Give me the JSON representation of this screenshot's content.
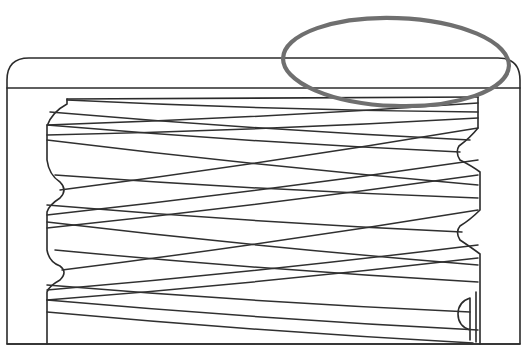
{
  "figure": {
    "caption_cropped": "",
    "colors": {
      "line": "#2b2b2b",
      "thread": "#303030",
      "annotation": "#6f6f6f",
      "background": "#ffffff"
    }
  },
  "frame": {
    "outer": {
      "left": 7,
      "top": 58,
      "right": 520,
      "bottom": 344,
      "corner_radius": 22
    },
    "inner_band_y": 88
  },
  "body": {
    "top_y": 99,
    "left_x": 47,
    "right_x": 479,
    "bottom_y": 344,
    "top_left_x": 67,
    "top_right_x": 478
  },
  "annotation": {
    "shape": "ellipse",
    "cx": 396,
    "cy": 62,
    "rx": 113,
    "ry": 44,
    "rotate_deg": 2,
    "highlights": "top-right edge of cap"
  },
  "threads": {
    "forward": [
      [
        47,
        125,
        478,
        103
      ],
      [
        47,
        135,
        478,
        118
      ],
      [
        60,
        190,
        478,
        128
      ],
      [
        47,
        215,
        478,
        160
      ],
      [
        47,
        228,
        478,
        175
      ],
      [
        62,
        270,
        478,
        210
      ],
      [
        47,
        290,
        478,
        245
      ],
      [
        47,
        300,
        478,
        258
      ]
    ],
    "backward": [
      [
        67,
        100,
        478,
        112
      ],
      [
        50,
        112,
        470,
        140
      ],
      [
        47,
        125,
        460,
        152
      ],
      [
        47,
        140,
        478,
        185
      ],
      [
        55,
        175,
        478,
        198
      ],
      [
        47,
        205,
        462,
        232
      ],
      [
        47,
        222,
        478,
        265
      ],
      [
        55,
        250,
        478,
        282
      ],
      [
        47,
        285,
        470,
        312
      ],
      [
        47,
        300,
        478,
        330
      ],
      [
        47,
        312,
        473,
        343
      ]
    ]
  }
}
